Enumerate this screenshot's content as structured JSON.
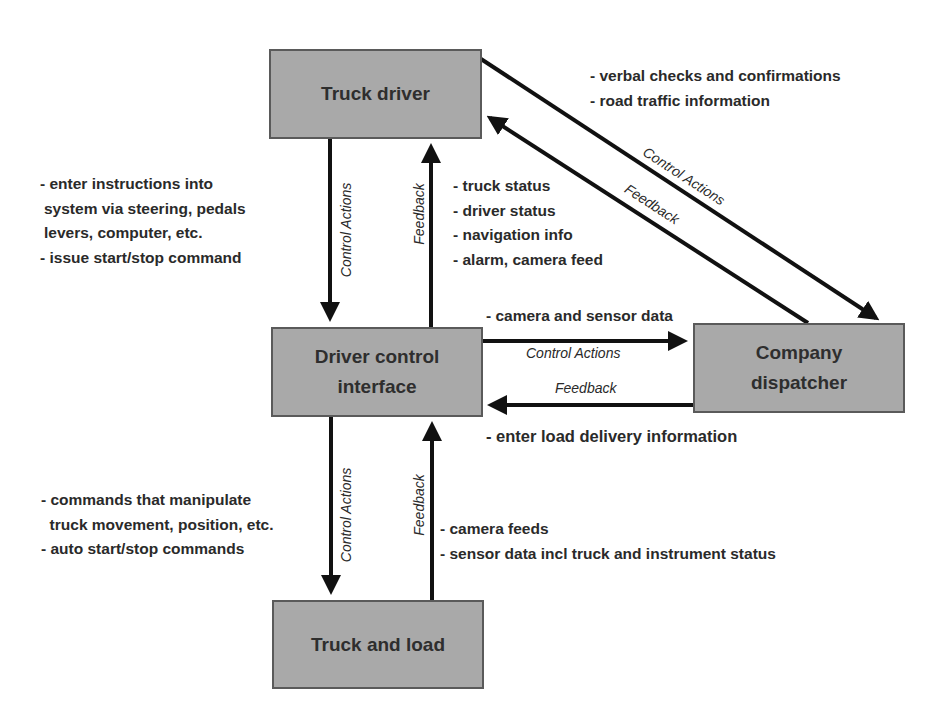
{
  "diagram": {
    "nodes": {
      "truck_driver": "Truck driver",
      "driver_control_interface": [
        "Driver control",
        "interface"
      ],
      "company_dispatcher": [
        "Company",
        "dispatcher"
      ],
      "truck_and_load": "Truck and load"
    },
    "edge_labels": {
      "control_actions": "Control Actions",
      "feedback": "Feedback"
    },
    "notes": {
      "driver_to_interface": [
        "- enter instructions into",
        " system via steering, pedals",
        " levers, computer, etc.",
        "- issue start/stop command"
      ],
      "interface_to_driver": [
        "- truck status",
        "- driver status",
        "- navigation info",
        "- alarm, camera feed"
      ],
      "dispatcher_driver": [
        "- verbal checks and confirmations",
        "- road traffic information"
      ],
      "interface_to_dispatcher": "- camera and sensor data",
      "dispatcher_to_interface": "- enter load delivery information",
      "interface_to_truck": [
        "- commands that manipulate",
        "  truck movement, position, etc.",
        "- auto start/stop commands"
      ],
      "truck_to_interface": [
        "- camera feeds",
        "- sensor data incl truck and instrument status"
      ]
    },
    "colors": {
      "box_fill": "#a9a9a9",
      "box_border": "#5a5a5a",
      "arrow": "#111111"
    }
  }
}
